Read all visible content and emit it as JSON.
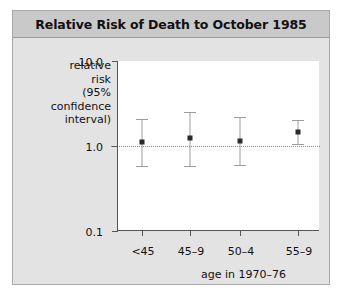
{
  "figure": {
    "title": "Relative Risk of Death to October 1985"
  },
  "chart_data": {
    "type": "scatter",
    "title": "Relative Risk of Death to October 1985",
    "xlabel": "age in 1970–76",
    "ylabel_lines": [
      "relative",
      "risk",
      "(95%",
      "confidence",
      "interval)"
    ],
    "yscale": "log",
    "ylim": [
      0.1,
      10.0
    ],
    "ytick_labels": [
      "10.0",
      "1.0",
      "0.1"
    ],
    "ytick_values": [
      10.0,
      1.0,
      0.1
    ],
    "categories": [
      "<45",
      "45–9",
      "50–4",
      "55–9"
    ],
    "reference_line": 1.0,
    "grid": false,
    "legend": "none",
    "points": [
      {
        "category": "<45",
        "value": 1.1,
        "ci_low": 0.58,
        "ci_high": 2.1
      },
      {
        "category": "45–9",
        "value": 1.25,
        "ci_low": 0.58,
        "ci_high": 2.5
      },
      {
        "category": "50–4",
        "value": 1.15,
        "ci_low": 0.6,
        "ci_high": 2.2
      },
      {
        "category": "55–9",
        "value": 1.45,
        "ci_low": 1.05,
        "ci_high": 2.0
      }
    ]
  }
}
